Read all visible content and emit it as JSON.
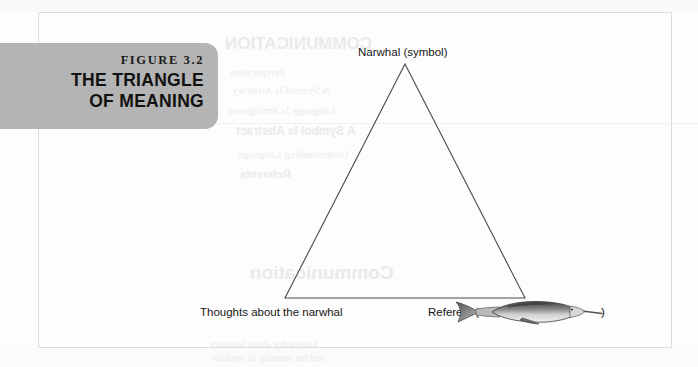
{
  "figure": {
    "number_label": "FIGURE 3.2",
    "title_line_1": "THE TRIANGLE",
    "title_line_2": "OF MEANING",
    "tab_color": "#b4b4b4",
    "tab_text_color": "#111111"
  },
  "diagram": {
    "type": "triangle-of-meaning",
    "stroke_color": "#4a4a4a",
    "vertices": {
      "apex": {
        "label": "Narwhal (symbol)",
        "x": 405,
        "y": 64
      },
      "bottom_left": {
        "label": "Thoughts about the narwhal",
        "x": 285,
        "y": 298
      },
      "bottom_right": {
        "label_prefix": "Referent (",
        "label_suffix": ")",
        "illustration": "narwhal-illustration",
        "x": 525,
        "y": 298
      }
    }
  },
  "page": {
    "background_color": "#fdfdfd",
    "frame_color": "#dcdcdc"
  },
  "background_ghost": {
    "note": "faint bleed-through text from reverse of printed page, illegible",
    "lines": [
      "Communication",
      "Perspectives",
      "A Symbol Is Arbitrary",
      "Language Is Ambiguous",
      "A Symbol Is Abstract",
      "Understanding Language",
      "Referents"
    ],
    "heading": "COMMUNICATION",
    "footer_line_1": "knowledge about language",
    "footer_line_2": "and the meaning of symbols"
  }
}
